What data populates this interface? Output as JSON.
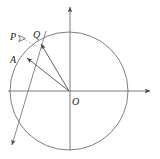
{
  "figure": {
    "type": "geometry-diagram",
    "background_color": "#ffffff",
    "stroke_color": "#555555",
    "label_color": "#1c1c1c",
    "canvas": {
      "width": 160,
      "height": 159
    },
    "labels": [
      {
        "id": "P",
        "text": "P",
        "x": 11,
        "y": 33
      },
      {
        "id": "Q",
        "text": "Q",
        "x": 33,
        "y": 31
      },
      {
        "id": "A",
        "text": "A",
        "x": 11,
        "y": 56
      },
      {
        "id": "O",
        "text": "O",
        "x": 72,
        "y": 98
      }
    ],
    "geometry": {
      "circle": {
        "cx": 69,
        "cy": 91,
        "r": 59
      },
      "origin": {
        "x": 69,
        "y": 91
      },
      "axes": {
        "x_axis": {
          "x1": 8,
          "y1": 91,
          "x2": 152,
          "y2": 91,
          "arrow": "end"
        },
        "y_axis": {
          "x1": 70,
          "y1": 150,
          "x2": 70,
          "y2": 5,
          "arrow": "end"
        }
      },
      "rays": [
        {
          "id": "OQ",
          "from": "O",
          "to": "Q",
          "x1": 69,
          "y1": 91,
          "x2": 40,
          "y2": 43,
          "arrow": "end"
        },
        {
          "id": "OA",
          "from": "O",
          "to": "A",
          "x1": 69,
          "y1": 91,
          "x2": 26,
          "y2": 58,
          "arrow": "end"
        }
      ],
      "secant_line": {
        "id": "line-through-P",
        "x1": 45,
        "y1": 33,
        "x2": 10,
        "y2": 148,
        "arrow": "end"
      },
      "marker": {
        "id": "P-pointer",
        "x": 22,
        "y": 38,
        "shape": "small-arrowhead"
      }
    }
  }
}
